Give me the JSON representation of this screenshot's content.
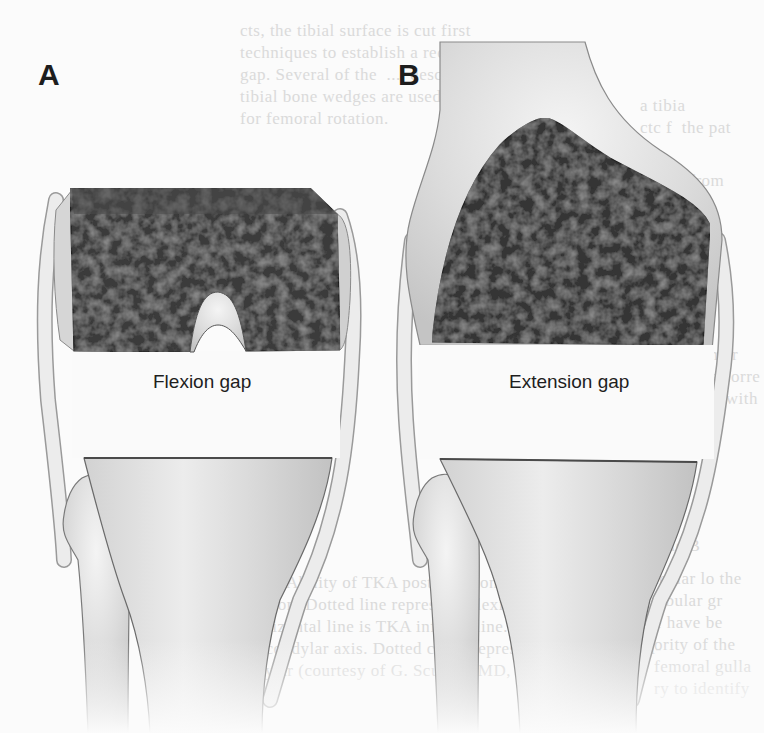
{
  "figure": {
    "type": "medical-illustration",
    "background_color": "#fbfbfb",
    "panels": [
      {
        "id": "A",
        "letter": "A",
        "letter_pos": [
          38,
          82
        ],
        "gap_label": "Flexion gap",
        "gap_label_pos": [
          153,
          395
        ],
        "femur_view": "flexed (posterior condyles resected, intercondylar notch visible)",
        "femur_color": "#3a3a3a",
        "femur_path": "M70,188 L310,188 L337,214 L340,350 L246,351 C240,312 233,294 218,292 C203,292 195,312 190,352 L74,351 L71,228 Z",
        "notch_path": "M190,352 C195,312 203,292 218,292 C233,294 240,312 246,351 C236,334 228,325 218,325 C208,325 200,336 194,352 Z",
        "tibia_path": "M84,458 L332,458 C325,510 300,560 280,600 C268,640 262,690 262,733 L150,733 C148,690 140,640 125,600 C112,565 100,520 84,458 Z",
        "tibia_cut_y": 458,
        "fibula_path": "M82,478 C96,470 118,474 126,505 C132,540 128,600 128,733 L88,733 C86,680 84,620 78,560 C70,545 60,535 64,515 C66,500 72,485 82,478 Z",
        "ligament_left": "M56,200 C44,260 42,320 48,400 C56,470 62,520 64,560",
        "ligament_right": "M340,216 C352,250 356,300 352,360 C348,440 340,520 300,600 C290,630 282,660 270,700"
      },
      {
        "id": "B",
        "letter": "B",
        "letter_pos": [
          398,
          82
        ],
        "gap_label": "Extension gap",
        "gap_label_pos": [
          509,
          395
        ],
        "femur_view": "extended (distal femur resected)",
        "femur_color": "#353535",
        "femur_path": "M432,342 C440,260 460,190 500,145 C520,125 538,118 546,118 C560,120 580,140 610,158 C650,180 700,200 710,225 L703,345 Z",
        "shaft_path": "M440,42 L585,42 C595,80 612,118 660,150 C700,175 722,200 722,240 L712,350 L420,345 C410,300 400,260 410,220 C420,180 436,150 440,110 Z",
        "tibia_path": "M440,459 L697,462 C690,510 670,555 650,600 C640,640 636,690 636,733 L520,733 C518,690 514,640 500,600 C490,560 470,520 440,459 Z",
        "tibia_cut_y": 460,
        "fibula_path": "C",
        "fibula_path_full": "M432,478 C446,470 468,474 476,505 C482,540 478,600 478,733 L438,733 C436,680 434,620 428,560 C420,545 410,535 414,515 C416,500 422,485 432,478 Z",
        "ligament_left": "M412,240 C404,300 402,360 406,420 C410,480 416,520 420,560",
        "ligament_right": "M718,240 C728,290 728,340 722,380 C712,460 700,530 660,600 C650,630 642,660 632,700"
      }
    ],
    "bleed_through_text": {
      "color": "#dadada",
      "note": "faint mirrored text from reverse side of scanned page",
      "blocks": [
        {
          "pos": [
            240,
            20
          ],
          "lines": [
            "cts, the tibial surface is cut first",
            "techniques to establish a rectangular",
            "gap. Several of the  ...  described. A",
            "tibial bone wedges are used measured resection",
            "for femoral rotation."
          ]
        },
        {
          "pos": [
            640,
            95
          ],
          "lines": [
            "a tibia",
            "ctc f  the pat"
          ]
        },
        {
          "pos": [
            648,
            170
          ],
          "lines": [
            "ation from",
            "andyles",
            "ng is",
            "d"
          ]
        },
        {
          "pos": [
            676,
            300
          ],
          "lines": [
            "in or",
            "s an",
            "fa femur",
            "es the corre",
            "nment with"
          ]
        },
        {
          "pos": [
            652,
            535
          ],
          "lines": [
            "ticle B"
          ]
        },
        {
          "pos": [
            654,
            568
          ],
          "lines": [
            "icular lo the",
            "fibular gr",
            "e have be",
            "ority of the",
            "femoral gulla",
            "ry to identify"
          ]
        },
        {
          "pos": [
            230,
            572
          ],
          "lines": [
            "FIG. 2. Ability of TKA posterior condylar cut and",
            "resection. Dotted line represents flexion femoral",
            "ta horizontal line is TKA inferior line. Solid line",
            "transcondylar axis. Dotted circle represents a posterior epi-",
            "condylar (courtesy of G. Scuderi, MD, New York, NY)."
          ]
        }
      ]
    }
  }
}
